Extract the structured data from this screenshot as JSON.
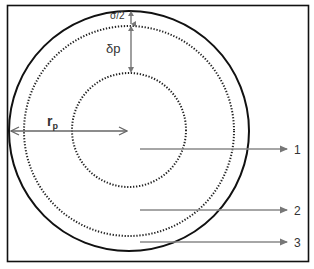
{
  "diagram": {
    "labels": {
      "sigma_half": "σ/2",
      "delta_p": "δp",
      "r_p_main": "r",
      "r_p_sub": "p",
      "marker_1": "1",
      "marker_2": "2",
      "marker_3": "3"
    },
    "colors": {
      "frame": "#111111",
      "outer_circle": "#111111",
      "dotted_circle": "#222222",
      "arrow": "#777777",
      "text": "#333333"
    },
    "circles": [
      {
        "name": "outer-solid",
        "cx": 129,
        "cy": 131,
        "r": 120,
        "style": "solid"
      },
      {
        "name": "middle-dotted",
        "cx": 129,
        "cy": 131,
        "r": 105,
        "style": "dotted"
      },
      {
        "name": "inner-dotted",
        "cx": 129,
        "cy": 130,
        "r": 57,
        "style": "dotted"
      }
    ],
    "trajectories": [
      {
        "label": "1",
        "y": 148
      },
      {
        "label": "2",
        "y": 210
      },
      {
        "label": "3",
        "y": 242
      }
    ]
  }
}
